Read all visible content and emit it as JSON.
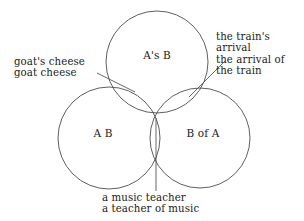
{
  "diagram": {
    "background_color": "#ffffff",
    "stroke_color": "#4d4d4d",
    "text_color": "#1a1a1a",
    "circles": [
      {
        "id": "top",
        "label": "A's B",
        "cx": 157,
        "cy": 62,
        "r": 51
      },
      {
        "id": "left",
        "label": "A B",
        "cx": 109,
        "cy": 138,
        "r": 51
      },
      {
        "id": "right",
        "label": "B of A",
        "cx": 200,
        "cy": 138,
        "r": 50
      }
    ],
    "annotations": [
      {
        "id": "left-annotation",
        "lines": [
          "goat's cheese",
          "goat cheese"
        ],
        "text": "goat's cheese\ngoat cheese",
        "points_to": "top-left-lens"
      },
      {
        "id": "right-annotation",
        "lines": [
          "the train's",
          "arrival",
          "the arrival of",
          "the train"
        ],
        "text": "the train's\narrival\nthe arrival of\nthe train",
        "points_to": "top-right-lens"
      },
      {
        "id": "bottom-annotation",
        "lines": [
          "a music teacher",
          "a teacher of music"
        ],
        "text": "a music teacher\na teacher of music",
        "points_to": "bottom-center-lens"
      }
    ]
  }
}
